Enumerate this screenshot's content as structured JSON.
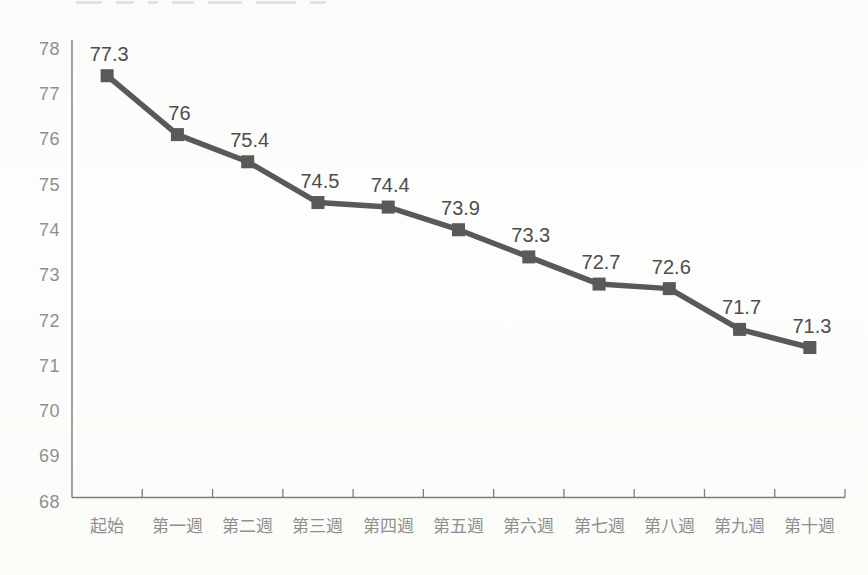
{
  "page": {
    "kind": "scanned-book-chart",
    "background": "#fcfcfa"
  },
  "chart_data": {
    "type": "line",
    "title": "",
    "xlabel": "",
    "ylabel": "",
    "categories": [
      "起始",
      "第一週",
      "第二週",
      "第三週",
      "第四週",
      "第五週",
      "第六週",
      "第七週",
      "第八週",
      "第九週",
      "第十週"
    ],
    "values": [
      77.3,
      76,
      75.4,
      74.5,
      74.4,
      73.9,
      73.3,
      72.7,
      72.6,
      71.7,
      71.3
    ],
    "data_labels": [
      "77.3",
      "76",
      "75.4",
      "74.5",
      "74.4",
      "73.9",
      "73.3",
      "72.7",
      "72.6",
      "71.7",
      "71.3"
    ],
    "y_ticks": [
      78,
      77,
      76,
      75,
      74,
      73,
      72,
      71,
      70,
      69,
      68
    ],
    "ylim": [
      68,
      78
    ],
    "grid": false,
    "legend": "none",
    "marker": "square",
    "colors": {
      "series": "#595959",
      "data_label": "#4d4d4d",
      "axis_label": "#8f8f8f",
      "axis_line": "#7d7d7d"
    }
  }
}
